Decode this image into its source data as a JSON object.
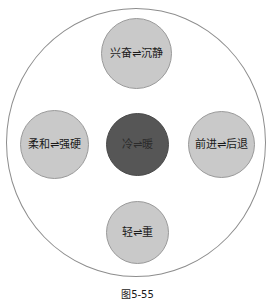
{
  "figure": {
    "caption": "图5-55",
    "outer_ring": {
      "name": "outer-boundary-circle",
      "fill": "#ffffff",
      "stroke": "#8d8d8d"
    },
    "colors": {
      "node_light_fill": "#c9c9c9",
      "node_dark_fill": "#565656",
      "node_stroke": "#9a9a9a",
      "label_text": "#1a1a1a",
      "background": "#ffffff"
    },
    "nodes": [
      {
        "id": "top",
        "label": "兴奋⇌沉静",
        "left_term": "兴奋",
        "right_term": "沉静",
        "relation_symbol": "⇌",
        "emphasis": "normal",
        "fill": "#c9c9c9"
      },
      {
        "id": "left",
        "label": "柔和⇌强硬",
        "left_term": "柔和",
        "right_term": "强硬",
        "relation_symbol": "⇌",
        "emphasis": "normal",
        "fill": "#c9c9c9"
      },
      {
        "id": "center",
        "label": "冷⇌暖",
        "left_term": "冷",
        "right_term": "暖",
        "relation_symbol": "⇌",
        "emphasis": "highlighted",
        "fill": "#565656"
      },
      {
        "id": "right",
        "label": "前进⇌后退",
        "left_term": "前进",
        "right_term": "后退",
        "relation_symbol": "⇌",
        "emphasis": "normal",
        "fill": "#c9c9c9"
      },
      {
        "id": "bottom",
        "label": "轻⇌重",
        "left_term": "轻",
        "right_term": "重",
        "relation_symbol": "⇌",
        "emphasis": "normal",
        "fill": "#c9c9c9"
      }
    ]
  }
}
